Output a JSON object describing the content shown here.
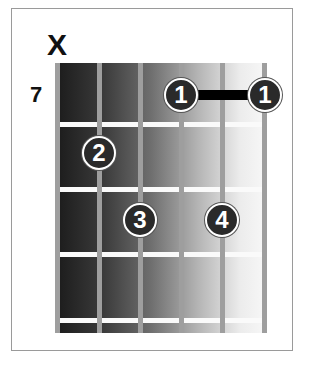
{
  "diagram": {
    "type": "guitar-chord",
    "mute_marker": "X",
    "start_fret": "7",
    "strings": 6,
    "frets_shown": 4,
    "muted_strings": [
      1
    ],
    "fingers": [
      {
        "finger": "1",
        "string": 4,
        "fret": 1
      },
      {
        "finger": "1",
        "string": 6,
        "fret": 1
      },
      {
        "finger": "2",
        "string": 2,
        "fret": 2
      },
      {
        "finger": "3",
        "string": 3,
        "fret": 3
      },
      {
        "finger": "4",
        "string": 5,
        "fret": 3
      }
    ],
    "barre": {
      "from_string": 4,
      "to_string": 6,
      "fret": 1
    }
  }
}
